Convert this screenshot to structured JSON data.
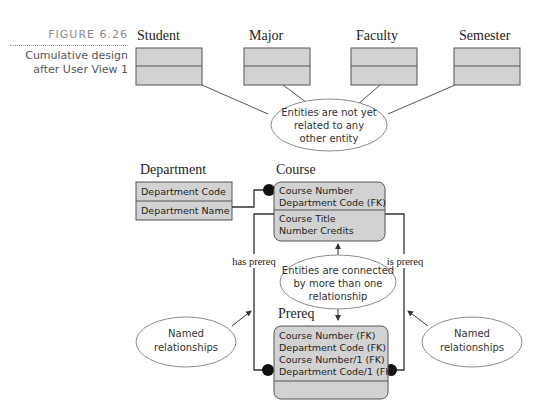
{
  "figure": {
    "number": "FIGURE 6.26",
    "caption_line1": "Cumulative design",
    "caption_line2": "after User View 1"
  },
  "entities": {
    "student": {
      "name": "Student"
    },
    "major": {
      "name": "Major"
    },
    "faculty": {
      "name": "Faculty"
    },
    "semester": {
      "name": "Semester"
    },
    "department": {
      "name": "Department",
      "attributes": [
        "Department Code",
        "Department Name"
      ]
    },
    "course": {
      "name": "Course",
      "key_attributes": [
        "Course Number",
        "Department Code (FK)"
      ],
      "attributes": [
        "Course Title",
        "Number Credits"
      ]
    },
    "prereq": {
      "name": "Prereq",
      "key_attributes": [
        "Course Number (FK)",
        "Department Code (FK)",
        "Course Number/1 (FK)",
        "Department Code/1 (FK)"
      ],
      "attributes": []
    }
  },
  "relationships": {
    "left_label": "has prereq",
    "right_label": "is prereq"
  },
  "callouts": {
    "unrelated": [
      "Entities are not yet",
      "related to any",
      "other entity"
    ],
    "connected": [
      "Entities are connected",
      "by more than one",
      "relationship"
    ],
    "named_left": [
      "Named",
      "relationships"
    ],
    "named_right": [
      "Named",
      "relationships"
    ]
  },
  "colors": {
    "entity_fill": "#d2d2d2",
    "entity_stroke": "#555555",
    "line": "#333333",
    "callout_stroke": "#8c8c8c",
    "caption_gray": "#8a8a8a"
  }
}
